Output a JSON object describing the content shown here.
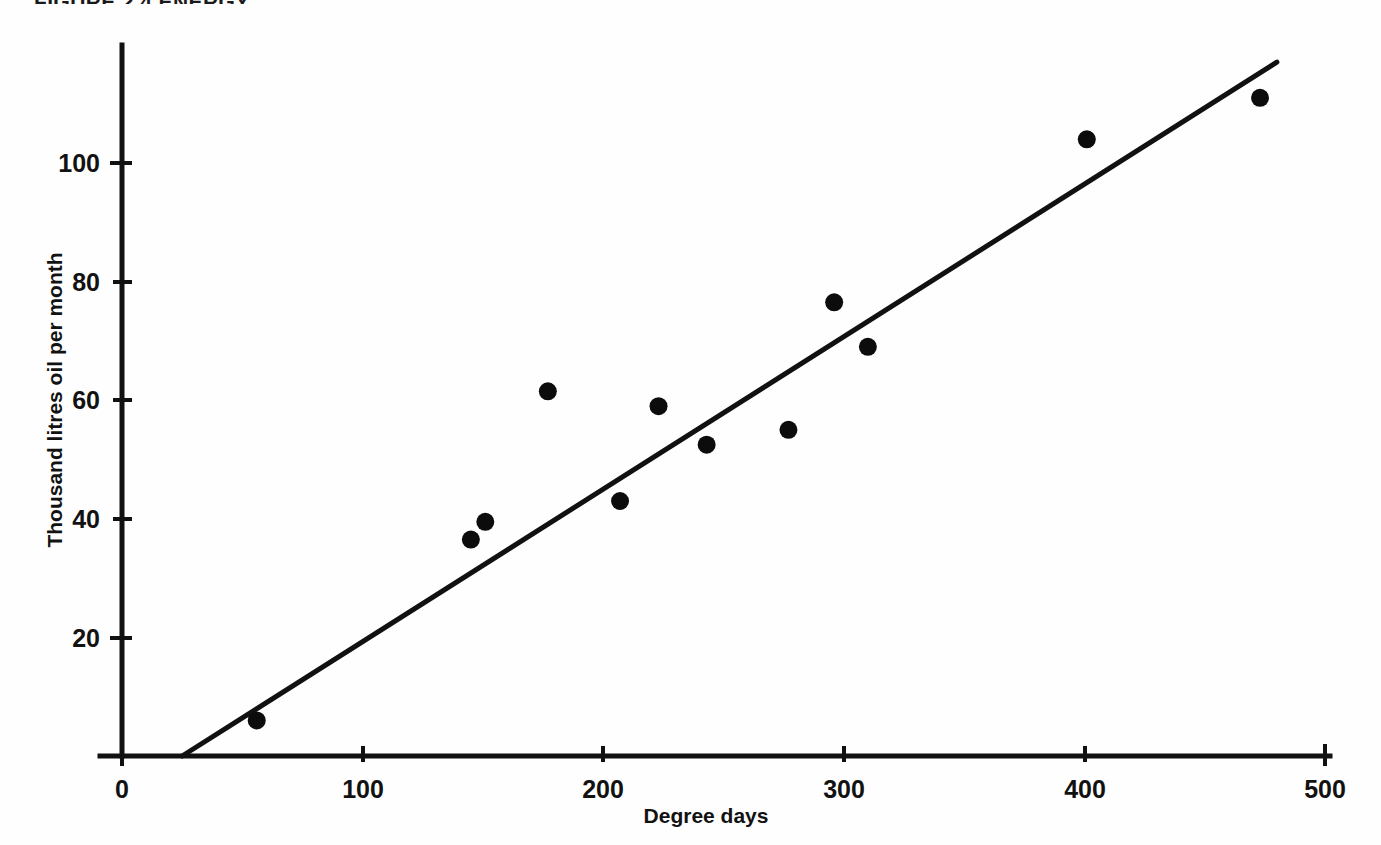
{
  "figure": {
    "title": "FIGURE 2.4  ENERGY",
    "title_truncated": true
  },
  "axes": {
    "x_label": "Degree days",
    "y_label": "Thousand litres oil per month",
    "x_ticks": [
      "0",
      "100",
      "200",
      "300",
      "400",
      "500"
    ],
    "y_ticks": [
      "100",
      "80",
      "60",
      "40",
      "20"
    ]
  },
  "chart_data": {
    "type": "scatter",
    "title": "FIGURE 2.4  ENERGY",
    "xlabel": "Degree days",
    "ylabel": "Thousand litres oil per month",
    "xlim": [
      0,
      500
    ],
    "ylim": [
      0,
      120
    ],
    "xticks": [
      0,
      100,
      200,
      300,
      400,
      500
    ],
    "yticks": [
      20,
      40,
      60,
      80,
      100
    ],
    "grid": false,
    "legend": null,
    "points": [
      {
        "x": 56,
        "y": 6
      },
      {
        "x": 145,
        "y": 36.5
      },
      {
        "x": 151,
        "y": 39.5
      },
      {
        "x": 177,
        "y": 61.5
      },
      {
        "x": 207,
        "y": 43
      },
      {
        "x": 223,
        "y": 59
      },
      {
        "x": 243,
        "y": 52.5
      },
      {
        "x": 277,
        "y": 55
      },
      {
        "x": 296,
        "y": 76.5
      },
      {
        "x": 310,
        "y": 69
      },
      {
        "x": 401,
        "y": 104
      },
      {
        "x": 473,
        "y": 111
      }
    ],
    "fit_line": {
      "label": "regression line",
      "x_start": 25,
      "y_start": 0,
      "x_end": 480,
      "y_end": 117
    }
  }
}
